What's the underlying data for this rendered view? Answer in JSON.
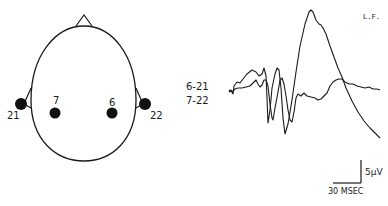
{
  "figure": {
    "condition_label": "L.F.",
    "head_diagram": {
      "electrodes": [
        {
          "id": "21",
          "label": "21",
          "position": "left-ear"
        },
        {
          "id": "7",
          "label": "7",
          "position": "left-scalp"
        },
        {
          "id": "6",
          "label": "6",
          "position": "right-scalp"
        },
        {
          "id": "22",
          "label": "22",
          "position": "right-ear"
        }
      ]
    },
    "traces": [
      {
        "label": "6-21",
        "description": "large positive peak"
      },
      {
        "label": "7-22",
        "description": "smaller response"
      }
    ],
    "scale_bar": {
      "voltage": "5µV",
      "time": "30 MSEC"
    },
    "colors": {
      "ink": "#1a1a1a",
      "background": "#ffffff"
    }
  }
}
